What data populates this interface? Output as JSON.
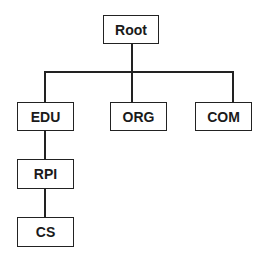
{
  "diagram": {
    "type": "tree",
    "nodes": {
      "root": "Root",
      "edu": "EDU",
      "org": "ORG",
      "com": "COM",
      "rpi": "RPI",
      "cs": "CS"
    },
    "edges": [
      [
        "Root",
        "EDU"
      ],
      [
        "Root",
        "ORG"
      ],
      [
        "Root",
        "COM"
      ],
      [
        "EDU",
        "RPI"
      ],
      [
        "RPI",
        "CS"
      ]
    ],
    "colors": {
      "line": "#222222",
      "text": "#1a1a1a",
      "background": "#ffffff"
    }
  }
}
